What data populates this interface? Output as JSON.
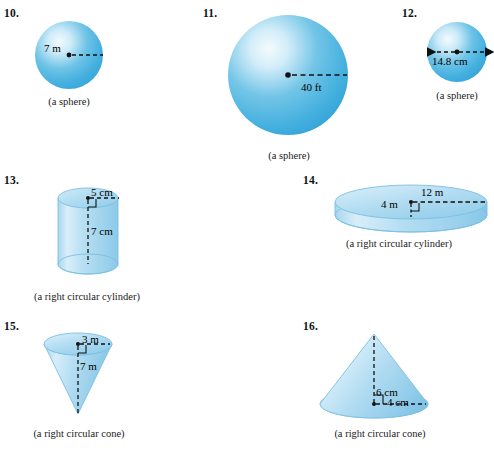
{
  "worksheet": {
    "title": "Volume exercises — spheres, cylinders, cones",
    "accent_blue": "#4db4e0",
    "highlight_blue": "#eaf6fc",
    "deep_blue": "#2f9fd4",
    "translucent_blue": "#b4dcf0",
    "dash_color": "#111111"
  },
  "problems": [
    {
      "number": "10.",
      "shape": "sphere",
      "caption": "(a sphere)",
      "measure_kind": "radius",
      "labels": [
        {
          "text": "7 m",
          "value": 7,
          "unit": "m"
        }
      ]
    },
    {
      "number": "11.",
      "shape": "sphere",
      "caption": "(a sphere)",
      "measure_kind": "radius",
      "labels": [
        {
          "text": "40 ft",
          "value": 40,
          "unit": "ft"
        }
      ]
    },
    {
      "number": "12.",
      "shape": "sphere",
      "caption": "(a sphere)",
      "measure_kind": "diameter",
      "labels": [
        {
          "text": "14.8 cm",
          "value": 14.8,
          "unit": "cm"
        }
      ]
    },
    {
      "number": "13.",
      "shape": "right-circular-cylinder",
      "caption": "(a right circular cylinder)",
      "measure_kind": "radius-and-height",
      "labels": [
        {
          "text": "5 cm",
          "value": 5,
          "unit": "cm"
        },
        {
          "text": "7 cm",
          "value": 7,
          "unit": "cm"
        }
      ]
    },
    {
      "number": "14.",
      "shape": "right-circular-cylinder",
      "caption": "(a right circular cylinder)",
      "measure_kind": "radius-and-height",
      "labels": [
        {
          "text": "12 m",
          "value": 12,
          "unit": "m"
        },
        {
          "text": "4 m",
          "value": 4,
          "unit": "m"
        }
      ]
    },
    {
      "number": "15.",
      "shape": "right-circular-cone",
      "caption": "(a right circular cone)",
      "measure_kind": "radius-and-height",
      "orientation": "apex-down",
      "labels": [
        {
          "text": "3 m",
          "value": 3,
          "unit": "m"
        },
        {
          "text": "7 m",
          "value": 7,
          "unit": "m"
        }
      ]
    },
    {
      "number": "16.",
      "shape": "right-circular-cone",
      "caption": "(a right circular cone)",
      "measure_kind": "height-and-radius",
      "orientation": "apex-up",
      "labels": [
        {
          "text": "6 cm",
          "value": 6,
          "unit": "cm"
        },
        {
          "text": "4 cm",
          "value": 4,
          "unit": "cm"
        }
      ]
    }
  ]
}
